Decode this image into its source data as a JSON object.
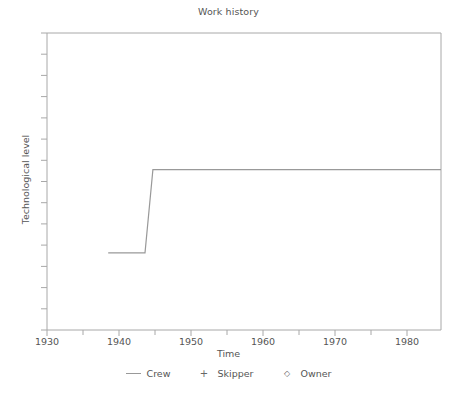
{
  "chart_data": {
    "type": "line",
    "title": "Work history",
    "xlabel": "Time",
    "ylabel": "Technological level",
    "xlim": [
      1930,
      1984.7
    ],
    "ylim": [
      0,
      15
    ],
    "grid": false,
    "legend_position": "bottom",
    "x_ticks_major": [
      1930,
      1940,
      1950,
      1960,
      1970,
      1980
    ],
    "x_tick_labels": [
      "1930",
      "1940",
      "1950",
      "1960",
      "1970",
      "1980"
    ],
    "x_ticks_minor": [
      1935,
      1945,
      1955,
      1965,
      1975
    ],
    "y_tick_count": 15,
    "y_tick_labels": [],
    "series": [
      {
        "name": "Crew",
        "marker": "line",
        "style": "step",
        "x": [
          1938.5,
          1943.6,
          1944.7,
          1984.7
        ],
        "y": [
          3.9,
          3.9,
          8.1,
          8.1
        ]
      },
      {
        "name": "Skipper",
        "marker": "+",
        "x": [],
        "y": []
      },
      {
        "name": "Owner",
        "marker": "diamond",
        "x": [],
        "y": []
      }
    ],
    "colors": {
      "line": "#999999",
      "axis": "#999999",
      "text": "#555555",
      "background": "#ffffff"
    }
  },
  "legend": {
    "entries": [
      {
        "label": "Crew",
        "key": "line-key-icon"
      },
      {
        "label": "Skipper",
        "key": "plus-marker-icon"
      },
      {
        "label": "Owner",
        "key": "diamond-marker-icon"
      }
    ]
  }
}
